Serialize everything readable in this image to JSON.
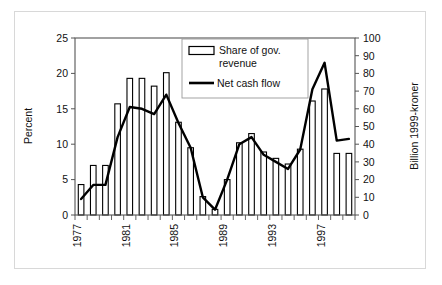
{
  "figure": {
    "frame_color": "#d8d8d8",
    "background": "#ffffff",
    "axis_color": "#000000",
    "bar_edge_color": "#000000",
    "bar_fill_color": "#ffffff",
    "line_color": "#000000"
  },
  "legend": {
    "bar_series_label": "Share of gov. revenue",
    "bar_series_label_line1": "Share of gov.",
    "bar_series_label_line2": "revenue",
    "line_series_label": "Net cash flow",
    "position": "top-center-right",
    "border_color": "#808080"
  },
  "left_axis": {
    "title": "Percent",
    "ticks": [
      "0",
      "5",
      "10",
      "15",
      "20",
      "25"
    ],
    "min": 0,
    "max": 25
  },
  "right_axis": {
    "title": "Billion 1999-kroner",
    "ticks": [
      "0",
      "10",
      "20",
      "30",
      "40",
      "50",
      "60",
      "70",
      "80",
      "90",
      "100"
    ],
    "min": 0,
    "max": 100
  },
  "x_axis": {
    "title": "",
    "tick_labels": [
      "1977",
      "1981",
      "1985",
      "1989",
      "1993",
      "1997"
    ],
    "label_rotation": -90,
    "label_step_years": 4
  },
  "chart_data": {
    "type": "bar",
    "title": "",
    "subtitle": "",
    "xlabel": "",
    "ylabel": "Percent",
    "y2label": "Billion 1999-kroner",
    "ylim": [
      0,
      25
    ],
    "y2lim": [
      0,
      100
    ],
    "grid": false,
    "legend_position": "top-center",
    "categories": [
      "1977",
      "1978",
      "1979",
      "1980",
      "1981",
      "1982",
      "1983",
      "1984",
      "1985",
      "1986",
      "1987",
      "1988",
      "1989",
      "1990",
      "1991",
      "1992",
      "1993",
      "1994",
      "1995",
      "1996",
      "1997",
      "1998",
      "1999"
    ],
    "series": [
      {
        "name": "Share of gov. revenue",
        "type": "bar",
        "axis": "left",
        "unit": "Percent",
        "values": [
          4.3,
          7.0,
          7.0,
          15.7,
          19.3,
          19.3,
          18.2,
          20.1,
          13.1,
          9.5,
          2.6,
          0.8,
          5.0,
          10.2,
          11.5,
          8.9,
          8.0,
          7.2,
          9.3,
          16.1,
          17.8,
          8.7,
          8.7
        ]
      },
      {
        "name": "Net cash flow",
        "type": "line",
        "axis": "right",
        "unit": "Billion 1999-kroner",
        "values": [
          9,
          17,
          17,
          44,
          61,
          60,
          57,
          68,
          52,
          38,
          10,
          3,
          20,
          40,
          44,
          34,
          30,
          26,
          37,
          71,
          86,
          42,
          43
        ]
      }
    ]
  }
}
